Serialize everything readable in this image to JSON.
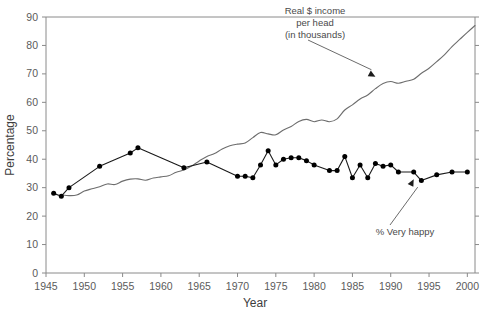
{
  "chart_data": {
    "type": "line",
    "title": "",
    "xlabel": "Year",
    "ylabel": "Percentage",
    "xlim": [
      1945,
      2001
    ],
    "ylim": [
      0,
      90
    ],
    "xticks": [
      1945,
      1950,
      1955,
      1960,
      1965,
      1970,
      1975,
      1980,
      1985,
      1990,
      1995,
      2000
    ],
    "yticks": [
      0,
      10,
      20,
      30,
      40,
      50,
      60,
      70,
      80,
      90
    ],
    "grid": false,
    "legend_position": "annotations-inline",
    "annotations": [
      {
        "name": "income-annotation",
        "text_lines": [
          "Real $ income",
          "per head",
          "(in thousands)"
        ],
        "points_to_year": 1988,
        "points_to_value": 69
      },
      {
        "name": "happiness-annotation",
        "text_lines": [
          "% Very happy"
        ],
        "points_to_year": 1993,
        "points_to_value": 33
      }
    ],
    "series": [
      {
        "name": "Real $ income per head (in thousands)",
        "style": "smooth-line-no-markers",
        "color": "#6d6d6d",
        "x": [
          1947,
          1948,
          1949,
          1950,
          1951,
          1952,
          1953,
          1954,
          1955,
          1956,
          1957,
          1958,
          1959,
          1960,
          1961,
          1962,
          1963,
          1964,
          1965,
          1966,
          1967,
          1968,
          1969,
          1970,
          1971,
          1972,
          1973,
          1974,
          1975,
          1976,
          1977,
          1978,
          1979,
          1980,
          1981,
          1982,
          1983,
          1984,
          1985,
          1986,
          1987,
          1988,
          1989,
          1990,
          1991,
          1992,
          1993,
          1994,
          1995,
          1996,
          1997,
          1998,
          1999,
          2000,
          2001
        ],
        "values": [
          27.5,
          27.2,
          27.4,
          28.8,
          29.6,
          30.3,
          31.3,
          31.1,
          32.3,
          33.0,
          33.1,
          32.6,
          33.4,
          33.8,
          34.2,
          35.4,
          36.2,
          37.6,
          39.4,
          41.0,
          42.0,
          43.6,
          44.7,
          45.3,
          45.7,
          47.6,
          49.4,
          48.9,
          48.6,
          50.3,
          51.5,
          53.3,
          54.0,
          53.2,
          53.8,
          53.2,
          54.2,
          57.3,
          59.1,
          61.2,
          62.6,
          64.8,
          66.6,
          67.3,
          66.7,
          67.4,
          68.1,
          70.2,
          72.0,
          74.3,
          76.7,
          79.6,
          82.1,
          84.6,
          87.0
        ]
      },
      {
        "name": "% Very happy",
        "style": "line-with-markers",
        "color": "#000000",
        "x": [
          1946,
          1947,
          1948,
          1952,
          1956,
          1957,
          1963,
          1966,
          1970,
          1971,
          1972,
          1973,
          1974,
          1975,
          1976,
          1977,
          1978,
          1979,
          1980,
          1982,
          1983,
          1984,
          1985,
          1986,
          1987,
          1988,
          1989,
          1990,
          1991,
          1993,
          1994,
          1996,
          1998,
          2000
        ],
        "values": [
          28.0,
          27.0,
          30.0,
          37.5,
          42.2,
          44.0,
          37.0,
          39.0,
          34.0,
          34.0,
          33.5,
          38.0,
          43.0,
          38.0,
          40.0,
          40.5,
          40.5,
          39.5,
          38.0,
          36.0,
          36.0,
          41.0,
          33.5,
          38.0,
          33.5,
          38.5,
          37.5,
          38.0,
          35.5,
          35.5,
          32.5,
          34.5,
          35.5,
          35.5
        ]
      }
    ]
  }
}
